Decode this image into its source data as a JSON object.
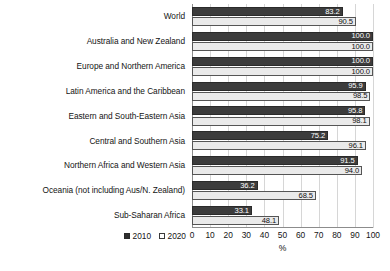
{
  "chart_data": {
    "type": "bar",
    "orientation": "horizontal",
    "title": "",
    "xlabel": "%",
    "ylabel": "",
    "xlim": [
      0,
      100
    ],
    "xticks": [
      0,
      10,
      20,
      30,
      40,
      50,
      60,
      70,
      80,
      90,
      100
    ],
    "grid": true,
    "legend_position": "bottom-left",
    "categories": [
      "World",
      "Australia and New Zealand",
      "Europe and Northern America",
      "Latin America and the Caribbean",
      "Eastern and South-Eastern Asia",
      "Central and Southern Asia",
      "Northern Africa and Western Asia",
      "Oceania (not including Aus/N. Zealand)",
      "Sub-Saharan Africa"
    ],
    "series": [
      {
        "name": "2010",
        "color": "#3c3c3c",
        "values": [
          83.2,
          100.0,
          100.0,
          95.9,
          95.8,
          75.2,
          91.5,
          36.2,
          33.1
        ],
        "labels": [
          "83.2",
          "100.0",
          "100.0",
          "95.9",
          "95.8",
          "75.2",
          "91.5",
          "36.2",
          "33.1"
        ]
      },
      {
        "name": "2020",
        "color": "#eaeaea",
        "values": [
          90.5,
          100.0,
          100.0,
          98.5,
          98.1,
          96.1,
          94.0,
          68.5,
          48.1
        ],
        "labels": [
          "90.5",
          "100.0",
          "100.0",
          "98.5",
          "98.1",
          "96.1",
          "94.0",
          "68.5",
          "48.1"
        ]
      }
    ]
  },
  "legend": {
    "items": [
      {
        "label": "2010"
      },
      {
        "label": "2020"
      }
    ]
  },
  "axis": {
    "x_title": "%"
  }
}
